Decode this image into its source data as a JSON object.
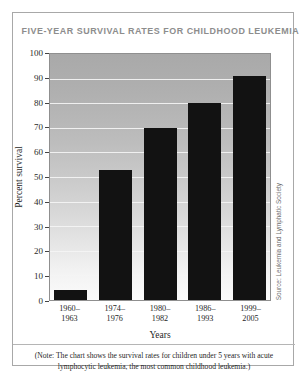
{
  "figure": {
    "title": "FIVE-YEAR SURVIVAL RATES FOR CHILDHOOD LEUKEMIA",
    "source": "Source: Leukemia and Lymphatic Society",
    "note": "(Note: The chart shows the survival rates for children under 5 years with acute lymphocytic leukemia, the most common childhood leukemia.)"
  },
  "colors": {
    "bar": "#121212",
    "title": "#8d8d8d",
    "border": "#a8a8a8",
    "gridline": "#f4f4f4",
    "plot_top": "#a9a9a9",
    "plot_bottom": "#fbfbfb"
  },
  "chart_data": {
    "type": "bar",
    "title": "FIVE-YEAR SURVIVAL RATES FOR CHILDHOOD LEUKEMIA",
    "xlabel": "Years",
    "ylabel": "Percent survival",
    "categories": [
      "1960–\n1963",
      "1974–\n1976",
      "1980–\n1982",
      "1986–\n1993",
      "1999–\n2005"
    ],
    "category_lines": [
      [
        "1960–",
        "1963"
      ],
      [
        "1974–",
        "1976"
      ],
      [
        "1980–",
        "1982"
      ],
      [
        "1986–",
        "1993"
      ],
      [
        "1999–",
        "2005"
      ]
    ],
    "values": [
      4,
      53,
      70,
      80,
      91
    ],
    "ylim": [
      0,
      100
    ],
    "yticks": [
      0,
      10,
      20,
      30,
      40,
      50,
      60,
      70,
      80,
      90,
      100
    ],
    "ytick_labels": [
      "0",
      "10",
      "20",
      "30",
      "40",
      "50",
      "60",
      "70",
      "80",
      "90",
      "100"
    ],
    "grid": true,
    "legend": false
  }
}
